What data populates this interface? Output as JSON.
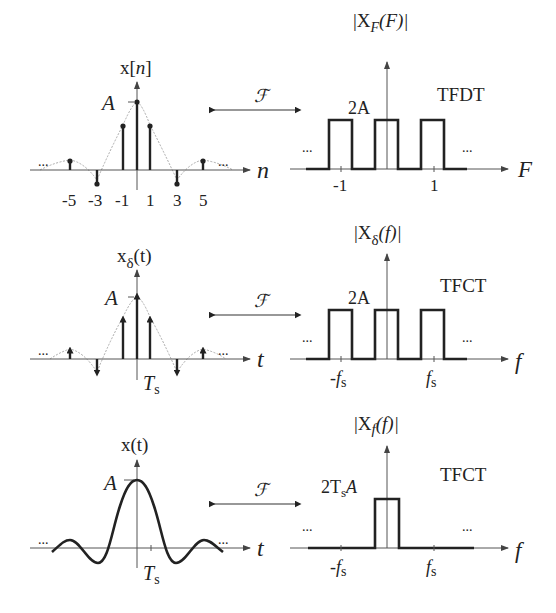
{
  "figure": {
    "rows": [
      {
        "id": "discrete",
        "time": {
          "ylabel_main": "x[",
          "ylabel_var": "n",
          "ylabel_close": "]",
          "amplitude_label": "A",
          "xlabel": "n",
          "ticks": [
            "-5",
            "-3",
            "-1",
            "1",
            "3",
            "5"
          ],
          "ellipsis_left": "...",
          "ellipsis_right": "..."
        },
        "transform_symbol": "ℱ",
        "freq": {
          "ylabel_main": "|X",
          "ylabel_sub": "F",
          "ylabel_arg": "(F)|",
          "height_label": "2A",
          "domain_label": "TFDT",
          "xlabel": "F",
          "ticks": [
            "-1",
            "1"
          ],
          "ellipsis_left": "...",
          "ellipsis_right": "..."
        }
      },
      {
        "id": "impulse-sampled",
        "time": {
          "ylabel_main": "x",
          "ylabel_sub": "δ",
          "ylabel_arg": "(t)",
          "amplitude_label": "A",
          "xlabel": "t",
          "tick_label": "T",
          "tick_sub": "s",
          "ellipsis_left": "...",
          "ellipsis_right": "..."
        },
        "transform_symbol": "ℱ",
        "freq": {
          "ylabel_main": "|X",
          "ylabel_sub": "δ",
          "ylabel_arg": "(f)|",
          "height_label": "2A",
          "domain_label": "TFCT",
          "xlabel": "f",
          "tick_neg": "-f",
          "tick_pos": "f",
          "tick_sub": "s",
          "ellipsis_left": "...",
          "ellipsis_right": "..."
        }
      },
      {
        "id": "continuous",
        "time": {
          "ylabel_main": "x(t)",
          "amplitude_label": "A",
          "xlabel": "t",
          "tick_label": "T",
          "tick_sub": "s",
          "ellipsis_left": "...",
          "ellipsis_right": "..."
        },
        "transform_symbol": "ℱ",
        "freq": {
          "ylabel_main": "|X",
          "ylabel_sub": "f",
          "ylabel_arg": "(f)|",
          "height_label_pre": "2T",
          "height_label_sub": "s",
          "height_label_post": "A",
          "domain_label": "TFCT",
          "xlabel": "f",
          "tick_neg": "-f",
          "tick_pos": "f",
          "tick_sub": "s",
          "ellipsis_left": "...",
          "ellipsis_right": "..."
        }
      }
    ]
  }
}
